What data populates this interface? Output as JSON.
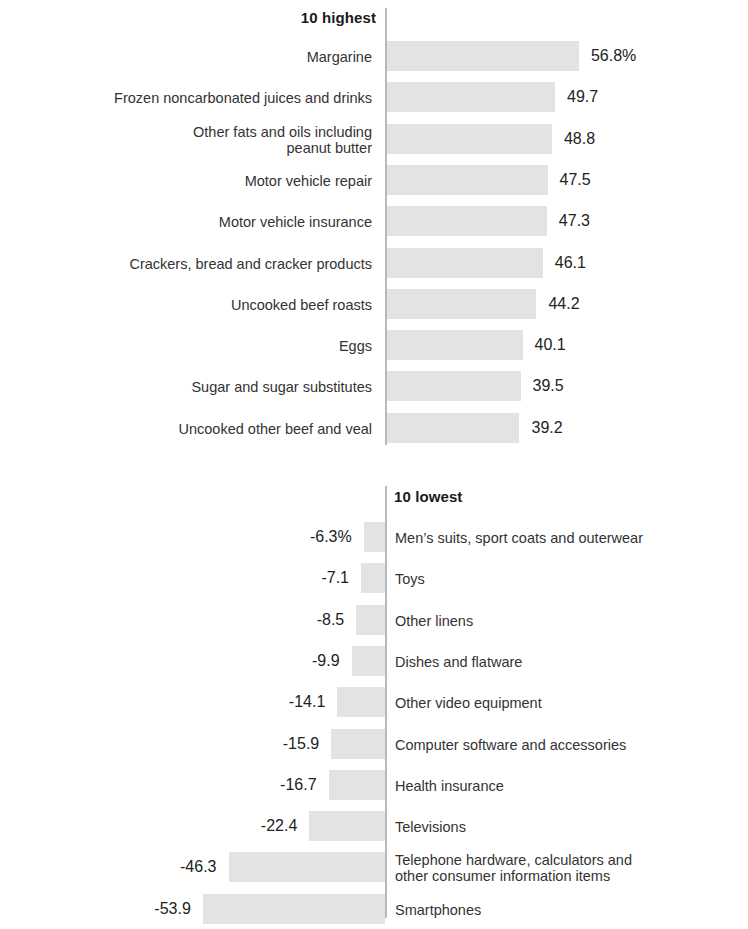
{
  "colors": {
    "bar": "#e3e3e3",
    "axis": "#b9b9b9",
    "label_text": "#333333",
    "value_text": "#222222",
    "title_text": "#1a1a1a",
    "background": "#ffffff"
  },
  "chart_data": {
    "type": "bar",
    "orientation": "horizontal",
    "title": "",
    "xlabel": "",
    "ylabel": "",
    "grid": false,
    "legend": null,
    "unit": "percent",
    "panels": [
      {
        "id": "highest",
        "title": "10 highest",
        "direction": "right",
        "axis_value": 0,
        "px_per_unit": 3.38,
        "categories": [
          "Margarine",
          "Frozen noncarbonated juices and drinks",
          "Other fats and oils including\npeanut butter",
          "Motor vehicle repair",
          "Motor vehicle insurance",
          "Crackers, bread and cracker products",
          "Uncooked beef roasts",
          "Eggs",
          "Sugar and sugar substitutes",
          "Uncooked other beef and veal"
        ],
        "values": [
          56.8,
          49.7,
          48.8,
          47.5,
          47.3,
          46.1,
          44.2,
          40.1,
          39.5,
          39.2
        ],
        "value_labels": [
          "56.8%",
          "49.7",
          "48.8",
          "47.5",
          "47.3",
          "46.1",
          "44.2",
          "40.1",
          "39.5",
          "39.2"
        ]
      },
      {
        "id": "lowest",
        "title": "10 lowest",
        "direction": "left",
        "axis_value": 0,
        "px_per_unit": 3.38,
        "categories": [
          "Men’s suits, sport coats and outerwear",
          "Toys",
          "Other linens",
          "Dishes and flatware",
          "Other video equipment",
          "Computer software and accessories",
          "Health insurance",
          "Televisions",
          "Telephone hardware, calculators and\nother consumer information items",
          "Smartphones"
        ],
        "values": [
          -6.3,
          -7.1,
          -8.5,
          -9.9,
          -14.1,
          -15.9,
          -16.7,
          -22.4,
          -46.3,
          -53.9
        ],
        "value_labels": [
          "-6.3%",
          "-7.1",
          "-8.5",
          "-9.9",
          "-14.1",
          "-15.9",
          "-16.7",
          "-22.4",
          "-46.3",
          "-53.9"
        ]
      }
    ]
  }
}
